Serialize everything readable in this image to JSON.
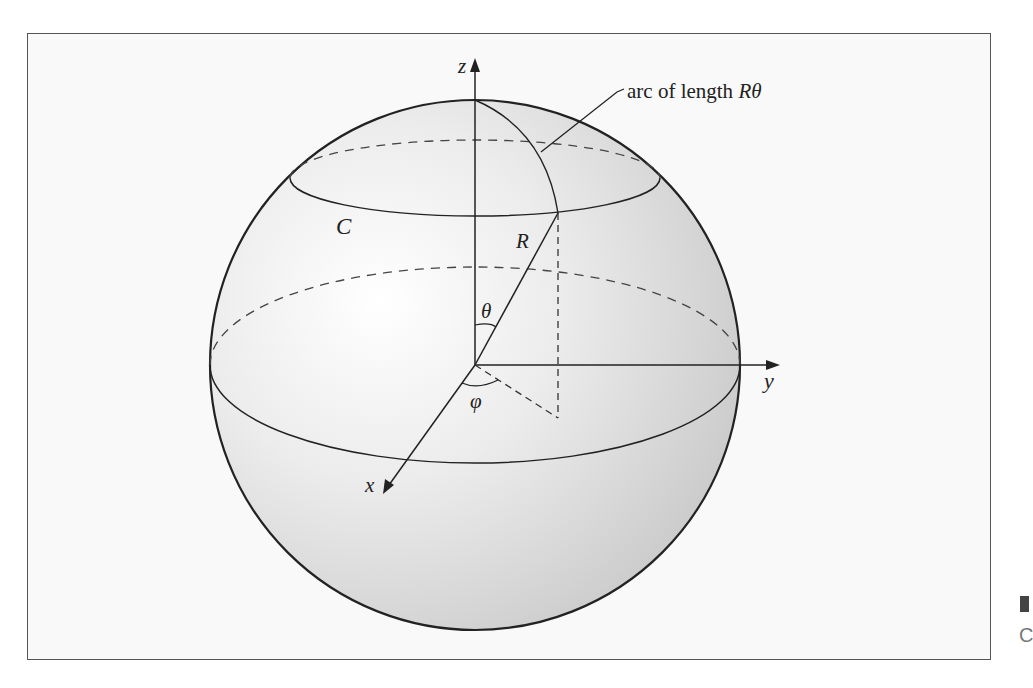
{
  "figure": {
    "labels": {
      "z_axis": "z",
      "y_axis": "y",
      "x_axis": "x",
      "circle": "C",
      "radius": "R",
      "polar_angle": "θ",
      "azimuth_angle": "φ",
      "arc_annotation_text": "arc of length ",
      "arc_annotation_math": "Rθ"
    },
    "colors": {
      "sphere_fill_light": "#ffffff",
      "sphere_fill_dark": "#cfcfcf",
      "stroke": "#222222",
      "frame_background": "#f9f9f9"
    }
  },
  "edge": {
    "clipped_glyph": "C"
  }
}
